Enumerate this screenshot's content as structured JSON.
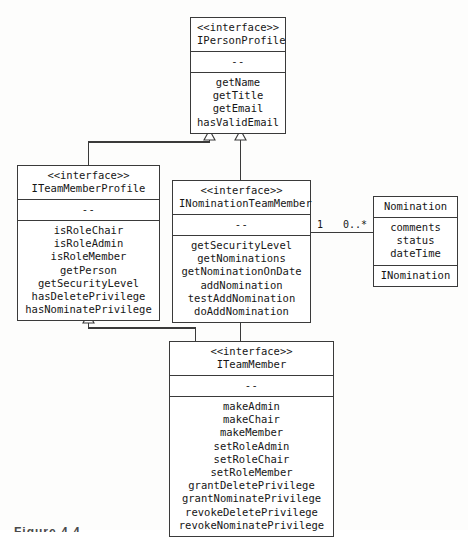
{
  "diagram": {
    "kind": "uml-class-diagram",
    "stereotype_label": "<<interface>>",
    "separator_label": "--",
    "colors": {
      "background": "#fdfdfc",
      "box_fill": "#ffffff",
      "line": "#3a3a3a",
      "text": "#161616"
    },
    "caption": "Figure 4.4"
  },
  "classes": {
    "person_profile": {
      "stereotype": "<<interface>>",
      "name": "IPersonProfile",
      "separator": "--",
      "members": [
        "getName",
        "getTitle",
        "getEmail",
        "hasValidEmail"
      ]
    },
    "team_member_profile": {
      "stereotype": "<<interface>>",
      "name": "ITeamMemberProfile",
      "separator": "--",
      "members": [
        "isRoleChair",
        "isRoleAdmin",
        "isRoleMember",
        "getPerson",
        "getSecurityLevel",
        "hasDeletePrivilege",
        "hasNominatePrivilege"
      ]
    },
    "nomination_team_member": {
      "stereotype": "<<interface>>",
      "name": "INominationTeamMember",
      "separator": "--",
      "members": [
        "getSecurityLevel",
        "getNominations",
        "getNominationOnDate",
        "addNomination",
        "testAddNomination",
        "doAddNomination"
      ]
    },
    "nomination": {
      "name": "Nomination",
      "attributes": [
        "comments",
        "status",
        "dateTime"
      ],
      "interface_compartment": "INomination"
    },
    "team_member": {
      "stereotype": "<<interface>>",
      "name": "ITeamMember",
      "separator": "--",
      "members": [
        "makeAdmin",
        "makeChair",
        "makeMember",
        "setRoleAdmin",
        "setRoleChair",
        "setRoleMember",
        "grantDeletePrivilege",
        "grantNominatePrivilege",
        "revokeDeletePrivilege",
        "revokeNominatePrivilege"
      ]
    }
  },
  "relationships": {
    "association_nomination": {
      "source_multiplicity": "1",
      "target_multiplicity": "0..*"
    }
  }
}
